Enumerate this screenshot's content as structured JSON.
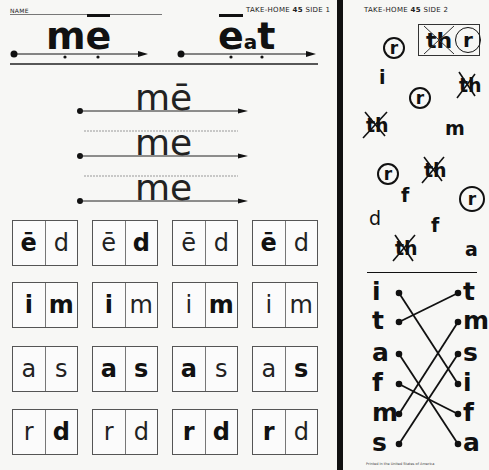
{
  "side1": {
    "name_label": "NAME",
    "header_prefix": "TAKE-HOME",
    "lesson_number": "45",
    "side_label": "SIDE 1",
    "title_words": [
      {
        "text": "mē",
        "letters": [
          "m",
          "e"
        ]
      },
      {
        "text": "ēat",
        "letters": [
          "e",
          "a",
          "t"
        ]
      }
    ],
    "trace_words": [
      "mē",
      "me",
      "me"
    ],
    "box_rows": [
      [
        {
          "left": "ē",
          "right": "d",
          "left_bold": true,
          "right_bold": false
        },
        {
          "left": "ē",
          "right": "d",
          "left_bold": false,
          "right_bold": true
        },
        {
          "left": "ē",
          "right": "d",
          "left_bold": false,
          "right_bold": false
        },
        {
          "left": "ē",
          "right": "d",
          "left_bold": true,
          "right_bold": false
        }
      ],
      [
        {
          "left": "i",
          "right": "m",
          "left_bold": true,
          "right_bold": true
        },
        {
          "left": "i",
          "right": "m",
          "left_bold": true,
          "right_bold": false
        },
        {
          "left": "i",
          "right": "m",
          "left_bold": false,
          "right_bold": true
        },
        {
          "left": "i",
          "right": "m",
          "left_bold": false,
          "right_bold": false
        }
      ],
      [
        {
          "left": "a",
          "right": "s",
          "left_bold": false,
          "right_bold": false
        },
        {
          "left": "a",
          "right": "s",
          "left_bold": true,
          "right_bold": true
        },
        {
          "left": "a",
          "right": "s",
          "left_bold": true,
          "right_bold": false
        },
        {
          "left": "a",
          "right": "s",
          "left_bold": false,
          "right_bold": true
        }
      ],
      [
        {
          "left": "r",
          "right": "d",
          "left_bold": false,
          "right_bold": true
        },
        {
          "left": "r",
          "right": "d",
          "left_bold": false,
          "right_bold": false
        },
        {
          "left": "r",
          "right": "d",
          "left_bold": true,
          "right_bold": true
        },
        {
          "left": "r",
          "right": "d",
          "left_bold": true,
          "right_bold": false
        }
      ]
    ]
  },
  "side2": {
    "header_prefix": "TAKE-HOME",
    "lesson_number": "45",
    "side_label": "SIDE 2",
    "target_box": {
      "crossed": "th",
      "circled": "r"
    },
    "scattered_letters": [
      "r",
      "i",
      "th",
      "r",
      "m",
      "th",
      "r",
      "th",
      "f",
      "r",
      "d",
      "f",
      "th",
      "a"
    ],
    "match_left": [
      "i",
      "t",
      "a",
      "f",
      "m",
      "s"
    ],
    "match_right": [
      "t",
      "m",
      "s",
      "i",
      "f",
      "a"
    ],
    "footer": "Printed in the United States of America"
  }
}
